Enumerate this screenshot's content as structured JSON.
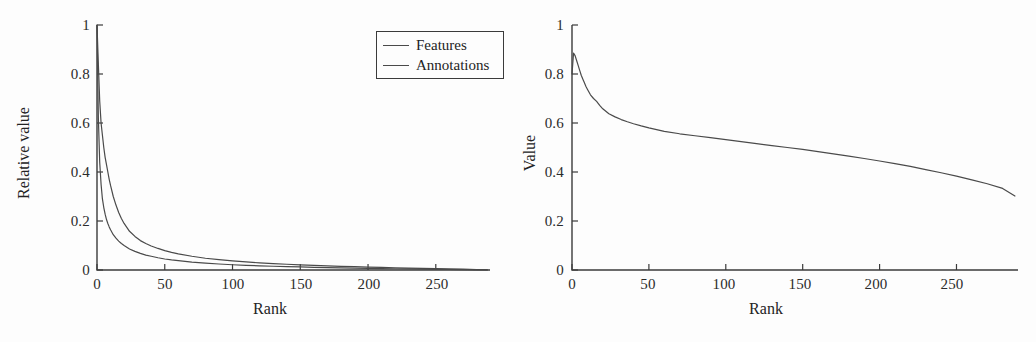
{
  "figure": {
    "background_color": "#fdfdfd",
    "line_color": "#4a4a4a",
    "axis_color": "#3b3b3b",
    "text_color": "#232323"
  },
  "chart_data": [
    {
      "type": "line",
      "panel": "left",
      "title": "",
      "xlabel": "Rank",
      "ylabel": "Relative value",
      "xlim": [
        0,
        290
      ],
      "ylim": [
        0,
        1
      ],
      "xticks": [
        0,
        50,
        100,
        150,
        200,
        250
      ],
      "xticklabels": [
        "0",
        "50",
        "100",
        "150",
        "200",
        "250"
      ],
      "yticks": [
        0,
        0.2,
        0.4,
        0.6,
        0.8,
        1
      ],
      "yticklabels": [
        "0",
        "0.2",
        "0.4",
        "0.6",
        "0.8",
        "1"
      ],
      "grid": false,
      "legend": [
        "Features",
        "Annotations"
      ],
      "legend_position": "upper right",
      "x": [
        0,
        1,
        2,
        3,
        4,
        5,
        6,
        7,
        8,
        9,
        10,
        12,
        14,
        16,
        18,
        20,
        24,
        28,
        32,
        36,
        40,
        45,
        50,
        55,
        60,
        70,
        80,
        90,
        100,
        110,
        120,
        130,
        140,
        150,
        160,
        170,
        180,
        190,
        200,
        210,
        220,
        230,
        240,
        250,
        260,
        270,
        280,
        288
      ],
      "series": [
        {
          "name": "Features",
          "values": [
            1.0,
            0.84,
            0.69,
            0.6,
            0.55,
            0.5,
            0.46,
            0.43,
            0.4,
            0.37,
            0.345,
            0.3,
            0.265,
            0.235,
            0.21,
            0.19,
            0.158,
            0.137,
            0.12,
            0.108,
            0.098,
            0.088,
            0.079,
            0.072,
            0.066,
            0.056,
            0.048,
            0.042,
            0.037,
            0.033,
            0.029,
            0.026,
            0.0235,
            0.021,
            0.0188,
            0.0168,
            0.015,
            0.0134,
            0.0119,
            0.0105,
            0.0092,
            0.008,
            0.0068,
            0.0057,
            0.0045,
            0.0033,
            0.0018,
            0.0006
          ]
        },
        {
          "name": "Annotations",
          "values": [
            1.0,
            0.62,
            0.44,
            0.35,
            0.29,
            0.255,
            0.228,
            0.206,
            0.19,
            0.176,
            0.164,
            0.144,
            0.13,
            0.118,
            0.108,
            0.1,
            0.086,
            0.076,
            0.068,
            0.061,
            0.056,
            0.05,
            0.045,
            0.041,
            0.038,
            0.032,
            0.028,
            0.0245,
            0.0215,
            0.0192,
            0.0172,
            0.0154,
            0.0138,
            0.0124,
            0.011,
            0.0098,
            0.0087,
            0.0077,
            0.0068,
            0.0059,
            0.005,
            0.0042,
            0.0035,
            0.0028,
            0.0021,
            0.0015,
            0.0008,
            0.0003
          ]
        }
      ]
    },
    {
      "type": "line",
      "panel": "right",
      "title": "",
      "xlabel": "Rank",
      "ylabel": "Value",
      "xlim": [
        0,
        290
      ],
      "ylim": [
        0,
        1
      ],
      "xticks": [
        0,
        50,
        100,
        150,
        200,
        250
      ],
      "xticklabels": [
        "0",
        "50",
        "100",
        "150",
        "200",
        "250"
      ],
      "yticks": [
        0,
        0.2,
        0.4,
        0.6,
        0.8,
        1
      ],
      "yticklabels": [
        "0",
        "0.2",
        "0.4",
        "0.6",
        "0.8",
        "1"
      ],
      "grid": false,
      "legend": [],
      "x": [
        0,
        1,
        2,
        3,
        4,
        5,
        6,
        7,
        8,
        9,
        10,
        12,
        14,
        16,
        18,
        20,
        24,
        28,
        32,
        36,
        40,
        45,
        50,
        60,
        70,
        80,
        90,
        100,
        110,
        120,
        130,
        140,
        150,
        160,
        170,
        180,
        190,
        200,
        210,
        220,
        230,
        240,
        250,
        260,
        270,
        280,
        288
      ],
      "series": [
        {
          "name": "Value",
          "values": [
            0.8,
            0.885,
            0.875,
            0.855,
            0.835,
            0.815,
            0.795,
            0.78,
            0.765,
            0.75,
            0.738,
            0.715,
            0.7,
            0.688,
            0.672,
            0.658,
            0.638,
            0.625,
            0.614,
            0.605,
            0.597,
            0.588,
            0.58,
            0.566,
            0.556,
            0.548,
            0.54,
            0.532,
            0.524,
            0.516,
            0.508,
            0.5,
            0.492,
            0.483,
            0.474,
            0.465,
            0.455,
            0.445,
            0.434,
            0.423,
            0.41,
            0.397,
            0.383,
            0.368,
            0.352,
            0.333,
            0.302
          ]
        }
      ]
    }
  ]
}
